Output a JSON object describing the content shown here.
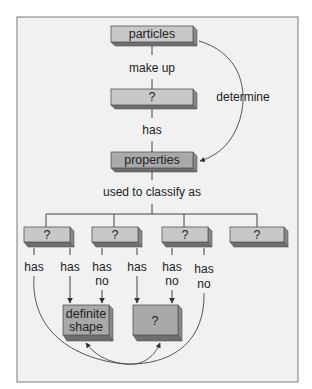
{
  "diagram": {
    "nodes": {
      "particles": "particles",
      "unknown_middle": "?",
      "properties": "properties",
      "class_1": "?",
      "class_2": "?",
      "class_3": "?",
      "class_4": "?",
      "definite_shape_line1": "definite",
      "definite_shape_line2": "shape",
      "unknown_bottom": "?"
    },
    "links": {
      "make_up": "make up",
      "has": "has",
      "determine": "determine",
      "used_to_classify_as": "used to classify as",
      "c1_left": "has",
      "c1_right": "has",
      "c2_left_1": "has",
      "c2_left_2": "no",
      "c2_right": "has",
      "c3_left_1": "has",
      "c3_left_2": "no",
      "c3_right_1": "has",
      "c3_right_2": "no"
    }
  }
}
